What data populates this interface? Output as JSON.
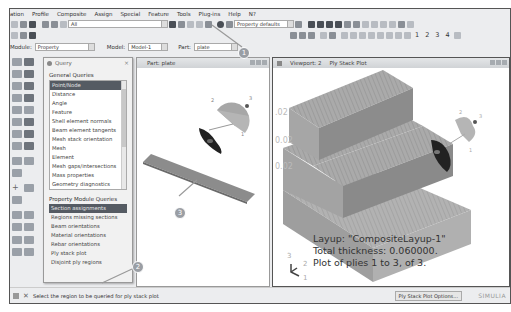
{
  "menubar": {
    "items": [
      "ation",
      "Profile",
      "Composite",
      "Assign",
      "Special",
      "Feature",
      "Tools",
      "Plug-ins",
      "Help",
      "N?"
    ]
  },
  "toolbar": {
    "selection_filter": "All",
    "render_style": "Property defaults",
    "view_numbers": [
      "1",
      "2",
      "3",
      "4"
    ]
  },
  "modulebar": {
    "module_label": "Module:",
    "module_value": "Property",
    "model_label": "Model:",
    "model_value": "Model-1",
    "part_label": "Part:",
    "part_value": "plate"
  },
  "query_dialog": {
    "title": "Query",
    "close": "×",
    "general_header": "General Queries",
    "general_items": [
      "Point/Node",
      "Distance",
      "Angle",
      "Feature",
      "Shell element normals",
      "Beam element tangents",
      "Mesh stack orientation",
      "Mesh",
      "Element",
      "Mesh gaps/intersections",
      "Mass properties",
      "Geometry diagnostics"
    ],
    "general_selected": 0,
    "property_header": "Property Module Queries",
    "property_items": [
      "Section assignments",
      "Regions missing sections",
      "Beam orientations",
      "Material orientations",
      "Rebar orientations",
      "Ply stack plot",
      "Disjoint ply regions"
    ],
    "property_selected": 0
  },
  "part_viewport": {
    "title": "Part: plate"
  },
  "plot_viewport": {
    "title": "Viewport: 2",
    "subtitle": "Ply Stack Plot",
    "layup_text": "Layup: \"CompositeLayup-1\"",
    "thickness_text": "Total thickness: 0.060000.",
    "plot_text": "Plot of plies 1 to 3, of 3.",
    "side_labels": [
      ".02",
      "0.02",
      "0.02"
    ],
    "axis_labels": [
      "3",
      "2",
      "1"
    ]
  },
  "callouts": [
    "1",
    "2",
    "3"
  ],
  "statusbar": {
    "prompt": "Select the region to be queried for ply stack plot",
    "options_button": "Ply Stack Plot Options...",
    "brand": "SIMULIA"
  },
  "colors": {
    "selection": "#555b63",
    "ply_gray": "#a8a8a8",
    "callout": "#9a9ea4"
  }
}
